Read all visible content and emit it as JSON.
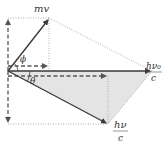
{
  "diagram": {
    "labels": {
      "electron_momentum": "mv",
      "incident_photon_num": "hν₀",
      "incident_photon_den": "c",
      "scattered_photon_num": "hν",
      "scattered_photon_den": "c",
      "electron_angle": "ϕ",
      "photon_angle": "θ"
    },
    "colors": {
      "vector": "#3a3a3a",
      "dashed": "#555555",
      "dotted": "#9a9a9a",
      "shade": "#e2e2e2"
    }
  }
}
